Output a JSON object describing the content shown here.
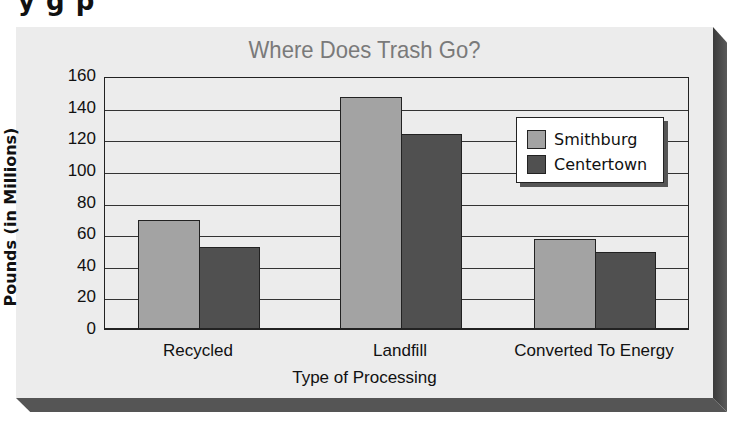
{
  "page": {
    "cut_off_heading": "y         g p"
  },
  "chart_data": {
    "type": "bar",
    "title": "Where Does Trash Go?",
    "xlabel": "Type of Processing",
    "ylabel": "Pounds (in Millions)",
    "categories": [
      "Recycled",
      "Landfill",
      "Converted To Energy"
    ],
    "series": [
      {
        "name": "Smithburg",
        "values": [
          68,
          146,
          56
        ],
        "color": "#a3a3a3"
      },
      {
        "name": "Centertown",
        "values": [
          51,
          123,
          48
        ],
        "color": "#505050"
      }
    ],
    "yticks": [
      "160",
      "140",
      "120",
      "100",
      "80",
      "60",
      "40",
      "20",
      "0"
    ],
    "ylim": [
      0,
      160
    ],
    "grid": true,
    "legend_position": "upper right, inside plot"
  }
}
